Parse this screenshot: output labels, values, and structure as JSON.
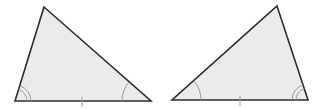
{
  "diagram": {
    "title": "",
    "colors": {
      "fill": "#ebebeb",
      "stroke": "#2e2e2e",
      "arc": "#9a9a9a",
      "tick": "#9a9a9a",
      "background": "#ffffff"
    },
    "triangles": [
      {
        "id": "left-triangle",
        "vertices": {
          "top": [
            44,
            7
          ],
          "bottom_left": [
            15,
            101
          ],
          "bottom_right": [
            151,
            101
          ]
        },
        "angle_marks": [
          {
            "vertex": "bottom_left",
            "arcs": 2,
            "radii": [
              12,
              16
            ]
          },
          {
            "vertex": "bottom_right",
            "arcs": 1,
            "radii": [
              29
            ]
          }
        ],
        "base_tick": {
          "x": 82,
          "y1": 97,
          "y2": 107
        }
      },
      {
        "id": "right-triangle",
        "vertices": {
          "top": [
            277,
            6
          ],
          "bottom_left": [
            172,
            100
          ],
          "bottom_right": [
            308,
            100
          ]
        },
        "angle_marks": [
          {
            "vertex": "bottom_left",
            "arcs": 1,
            "radii": [
              29
            ]
          },
          {
            "vertex": "bottom_right",
            "arcs": 2,
            "radii": [
              12,
              16
            ]
          }
        ],
        "base_tick": {
          "x": 240,
          "y1": 96,
          "y2": 106
        }
      }
    ]
  }
}
